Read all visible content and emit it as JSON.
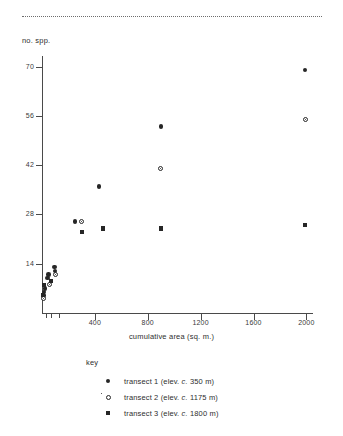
{
  "chart_data": {
    "type": "scatter",
    "title": "",
    "xlabel": "cumulative area (sq. m.)",
    "ylabel": "no. spp.",
    "xlim": [
      0,
      2050
    ],
    "ylim": [
      0,
      73
    ],
    "xticks": [
      400,
      800,
      1200,
      1600,
      2000
    ],
    "xminor_ticks": [
      30,
      70,
      130
    ],
    "yticks": [
      14,
      28,
      42,
      56,
      70
    ],
    "grid": false,
    "legend_title": "key",
    "legend_position": "below-axes",
    "series": [
      {
        "name": "transect 1 (elev. c. 350 m)",
        "marker": "filled-circle",
        "color": "#262626",
        "points": [
          {
            "x": 10,
            "y": 5
          },
          {
            "x": 14,
            "y": 6
          },
          {
            "x": 22,
            "y": 7
          },
          {
            "x": 40,
            "y": 10
          },
          {
            "x": 48,
            "y": 11
          },
          {
            "x": 95,
            "y": 13
          },
          {
            "x": 100,
            "y": 12
          },
          {
            "x": 250,
            "y": 26
          },
          {
            "x": 430,
            "y": 36
          },
          {
            "x": 900,
            "y": 53
          },
          {
            "x": 1990,
            "y": 69
          }
        ]
      },
      {
        "name": "transect 2 (elev. c. 1175 m)",
        "marker": "open-circle",
        "color": "#262626",
        "points": [
          {
            "x": 12,
            "y": 4
          },
          {
            "x": 60,
            "y": 8
          },
          {
            "x": 105,
            "y": 11
          },
          {
            "x": 300,
            "y": 26
          },
          {
            "x": 900,
            "y": 41
          },
          {
            "x": 1990,
            "y": 55
          }
        ]
      },
      {
        "name": "transect 3 (elev. c. 1800 m)",
        "marker": "filled-square",
        "color": "#262626",
        "points": [
          {
            "x": 8,
            "y": 5
          },
          {
            "x": 18,
            "y": 8
          },
          {
            "x": 70,
            "y": 9
          },
          {
            "x": 300,
            "y": 23
          },
          {
            "x": 460,
            "y": 24
          },
          {
            "x": 900,
            "y": 24
          },
          {
            "x": 1990,
            "y": 25
          }
        ]
      }
    ]
  },
  "axes": {
    "y_title": "no. spp.",
    "x_title": "cumulative area (sq. m.)",
    "y_tick_labels": [
      "70",
      "56",
      "42",
      "28",
      "14"
    ],
    "x_tick_labels": [
      "400",
      "800",
      "1200",
      "1600",
      "2000"
    ]
  },
  "legend": {
    "title": "key",
    "entries": [
      {
        "marker": "filled-circle",
        "label": "transect 1 (elev. c. 350 m)"
      },
      {
        "marker": "open-circle",
        "label": "transect 2 (elev. c. 1175 m)"
      },
      {
        "marker": "filled-square",
        "label": "transect 3 (elev. c. 1800 m)"
      }
    ]
  }
}
